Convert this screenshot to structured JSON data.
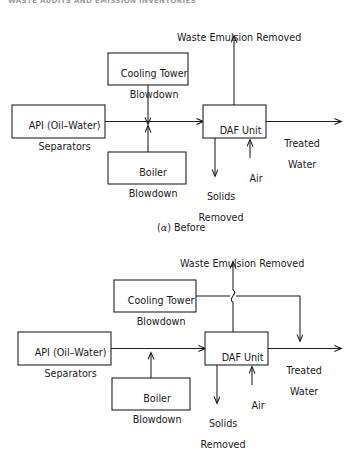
{
  "page": {
    "running_header": "WASTE AUDITS AND EMISSION INVENTORIES",
    "background_color": "#ffffff",
    "line_color": "#1a1a1a",
    "width": 349,
    "height": 441
  },
  "figures": [
    {
      "id": "before",
      "caption_prefix": "(",
      "caption_symbol": "α",
      "caption_suffix": ") Before",
      "caption_full": "(α) Before",
      "boxes": [
        {
          "name": "cooling-tower-blowdown",
          "line1": "Cooling Tower",
          "line2": "Blowdown",
          "x": 108,
          "y": 53,
          "w": 80,
          "h": 32
        },
        {
          "name": "api-separators",
          "line1": "API (Oil–Water)",
          "line2": "Separators",
          "x": 12,
          "y": 105,
          "w": 93,
          "h": 33
        },
        {
          "name": "daf-unit",
          "line1": "DAF Unit",
          "line2": "",
          "x": 203,
          "y": 105,
          "w": 63,
          "h": 33
        },
        {
          "name": "boiler-blowdown",
          "line1": "Boiler",
          "line2": "Blowdown",
          "x": 108,
          "y": 152,
          "w": 78,
          "h": 32
        }
      ],
      "labels": [
        {
          "name": "waste-emulsion-removed-label",
          "line1": "Waste Emulsion Removed",
          "line2": "",
          "cx": 233,
          "y": 22
        },
        {
          "name": "treated-water-label",
          "line1": "Treated",
          "line2": "Water",
          "cx": 296,
          "y": 128
        },
        {
          "name": "air-label",
          "line1": "Air",
          "line2": "",
          "cx": 250,
          "y": 163
        },
        {
          "name": "solids-removed-label",
          "line1": "Solids",
          "line2": "Removed",
          "cx": 215,
          "y": 181
        }
      ]
    },
    {
      "id": "after",
      "caption_prefix": "",
      "caption_symbol": "",
      "caption_suffix": "",
      "caption_full": "",
      "boxes": [
        {
          "name": "cooling-tower-blowdown",
          "line1": "Cooling Tower",
          "line2": "Blowdown",
          "x": 114,
          "y": 280,
          "w": 82,
          "h": 32
        },
        {
          "name": "api-separators",
          "line1": "API (Oil–Water)",
          "line2": "Separators",
          "x": 18,
          "y": 332,
          "w": 93,
          "h": 33
        },
        {
          "name": "daf-unit",
          "line1": "DAF Unit",
          "line2": "",
          "x": 205,
          "y": 332,
          "w": 63,
          "h": 33
        },
        {
          "name": "boiler-blowdown",
          "line1": "Boiler",
          "line2": "Blowdown",
          "x": 112,
          "y": 378,
          "w": 78,
          "h": 32
        }
      ],
      "labels": [
        {
          "name": "waste-emulsion-removed-label",
          "line1": "Waste Emulsion Removed",
          "line2": "",
          "cx": 236,
          "y": 248
        },
        {
          "name": "treated-water-label",
          "line1": "Treated",
          "line2": "Water",
          "cx": 298,
          "y": 355
        },
        {
          "name": "air-label",
          "line1": "Air",
          "line2": "",
          "cx": 252,
          "y": 390
        },
        {
          "name": "solids-removed-label",
          "line1": "Solids",
          "line2": "Removed",
          "cx": 217,
          "y": 408
        }
      ]
    }
  ]
}
